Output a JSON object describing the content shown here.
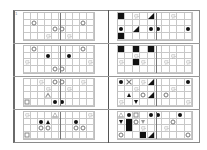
{
  "figure": {
    "label": "1",
    "grid": {
      "cols": 10,
      "rows": 4
    },
    "colors": {
      "frame": "#8a8a8a",
      "grid": "#c8c8c8",
      "ink": "#111111",
      "outline": "#777777"
    },
    "legend_symbols": [
      "circle",
      "gear",
      "dot",
      "square-fill",
      "square",
      "tri-corner",
      "tri-up",
      "tri-down",
      "tri-open",
      "x",
      "v"
    ],
    "panels": [
      {
        "id": "L1",
        "side": "left",
        "row": 0,
        "symbols": [
          {
            "c": 1,
            "r": 1,
            "t": "circle"
          },
          {
            "c": 8,
            "r": 1,
            "t": "circle"
          },
          {
            "c": 4,
            "r": 2,
            "t": "circle"
          },
          {
            "c": 5,
            "r": 2,
            "t": "circle"
          },
          {
            "c": 3,
            "r": 3,
            "t": "gear"
          },
          {
            "c": 6,
            "r": 3,
            "t": "gear"
          }
        ]
      },
      {
        "id": "R1",
        "side": "right",
        "row": 0,
        "symbols": [
          {
            "c": 0,
            "r": 0,
            "t": "square-fill"
          },
          {
            "c": 2,
            "r": 0,
            "t": "gear"
          },
          {
            "c": 4,
            "r": 0,
            "t": "tri-corner"
          },
          {
            "c": 7,
            "r": 0,
            "t": "gear"
          },
          {
            "c": 0,
            "r": 2,
            "t": "dot"
          },
          {
            "c": 2,
            "r": 2,
            "t": "tri-corner"
          },
          {
            "c": 4,
            "r": 2,
            "t": "dot"
          },
          {
            "c": 5,
            "r": 2,
            "t": "dot"
          },
          {
            "c": 9,
            "r": 2,
            "t": "dot"
          },
          {
            "c": 0,
            "r": 3,
            "t": "square-fill"
          }
        ]
      },
      {
        "id": "L2",
        "side": "left",
        "row": 1,
        "symbols": [
          {
            "c": 1,
            "r": 0,
            "t": "circle"
          },
          {
            "c": 8,
            "r": 0,
            "t": "circle"
          },
          {
            "c": 3,
            "r": 1,
            "t": "dot"
          },
          {
            "c": 6,
            "r": 1,
            "t": "dot"
          },
          {
            "c": 0,
            "r": 2,
            "t": "gear"
          },
          {
            "c": 9,
            "r": 2,
            "t": "gear"
          },
          {
            "c": 4,
            "r": 3,
            "t": "circle"
          },
          {
            "c": 5,
            "r": 3,
            "t": "circle"
          }
        ]
      },
      {
        "id": "R2",
        "side": "right",
        "row": 1,
        "symbols": [
          {
            "c": 0,
            "r": 0,
            "t": "square-fill"
          },
          {
            "c": 2,
            "r": 0,
            "t": "square-fill"
          },
          {
            "c": 4,
            "r": 0,
            "t": "square-fill"
          },
          {
            "c": 2,
            "r": 1,
            "t": "gear"
          },
          {
            "c": 7,
            "r": 1,
            "t": "gear"
          },
          {
            "c": 0,
            "r": 2,
            "t": "gear"
          },
          {
            "c": 2,
            "r": 2,
            "t": "square-fill"
          },
          {
            "c": 3,
            "r": 2,
            "t": "gear"
          },
          {
            "c": 6,
            "r": 2,
            "t": "gear"
          },
          {
            "c": 9,
            "r": 2,
            "t": "gear"
          }
        ]
      },
      {
        "id": "L3",
        "side": "left",
        "row": 2,
        "symbols": [
          {
            "c": 2,
            "r": 0,
            "t": "gear"
          },
          {
            "c": 4,
            "r": 0,
            "t": "circle"
          },
          {
            "c": 5,
            "r": 0,
            "t": "circle"
          },
          {
            "c": 8,
            "r": 0,
            "t": "gear"
          },
          {
            "c": 3,
            "r": 1,
            "t": "gear"
          },
          {
            "c": 6,
            "r": 1,
            "t": "gear"
          },
          {
            "c": 3,
            "r": 2,
            "t": "tri-open"
          },
          {
            "c": 0,
            "r": 3,
            "t": "square"
          },
          {
            "c": 4,
            "r": 3,
            "t": "dot"
          },
          {
            "c": 5,
            "r": 3,
            "t": "dot"
          }
        ]
      },
      {
        "id": "R3",
        "side": "right",
        "row": 2,
        "symbols": [
          {
            "c": 0,
            "r": 0,
            "t": "dot"
          },
          {
            "c": 1,
            "r": 0,
            "t": "x"
          },
          {
            "c": 3,
            "r": 0,
            "t": "gear"
          },
          {
            "c": 4,
            "r": 0,
            "t": "tri-corner"
          },
          {
            "c": 9,
            "r": 0,
            "t": "dot"
          },
          {
            "c": 2,
            "r": 1,
            "t": "gear"
          },
          {
            "c": 7,
            "r": 1,
            "t": "gear"
          },
          {
            "c": 1,
            "r": 2,
            "t": "tri-up"
          },
          {
            "c": 3,
            "r": 2,
            "t": "circle"
          },
          {
            "c": 4,
            "r": 2,
            "t": "tri-corner"
          },
          {
            "c": 6,
            "r": 2,
            "t": "circle"
          },
          {
            "c": 0,
            "r": 3,
            "t": "gear"
          },
          {
            "c": 2,
            "r": 3,
            "t": "tri-down"
          },
          {
            "c": 9,
            "r": 3,
            "t": "gear"
          }
        ]
      },
      {
        "id": "L4",
        "side": "left",
        "row": 3,
        "symbols": [
          {
            "c": 0,
            "r": 0,
            "t": "gear"
          },
          {
            "c": 4,
            "r": 0,
            "t": "tri-open"
          },
          {
            "c": 9,
            "r": 0,
            "t": "gear"
          },
          {
            "c": 2,
            "r": 1,
            "t": "dot"
          },
          {
            "c": 3,
            "r": 1,
            "t": "tri-up"
          },
          {
            "c": 7,
            "r": 1,
            "t": "dot"
          },
          {
            "c": 2,
            "r": 2,
            "t": "circle"
          },
          {
            "c": 3,
            "r": 2,
            "t": "circle"
          },
          {
            "c": 7,
            "r": 2,
            "t": "circle"
          },
          {
            "c": 8,
            "r": 2,
            "t": "circle"
          },
          {
            "c": 0,
            "r": 3,
            "t": "square"
          }
        ]
      },
      {
        "id": "R4",
        "side": "right",
        "row": 3,
        "symbols": [
          {
            "c": 0,
            "r": 0,
            "t": "tri-open"
          },
          {
            "c": 1,
            "r": 0,
            "t": "dot"
          },
          {
            "c": 2,
            "r": 0,
            "t": "square"
          },
          {
            "c": 4,
            "r": 0,
            "t": "dot"
          },
          {
            "c": 5,
            "r": 0,
            "t": "dot"
          },
          {
            "c": 8,
            "r": 0,
            "t": "dot"
          },
          {
            "c": 0,
            "r": 1,
            "t": "tri-down"
          },
          {
            "c": 1,
            "r": 1,
            "t": "square-fill"
          },
          {
            "c": 2,
            "r": 1,
            "t": "circle"
          },
          {
            "c": 3,
            "r": 1,
            "t": "v"
          },
          {
            "c": 7,
            "r": 1,
            "t": "circle"
          },
          {
            "c": 1,
            "r": 2,
            "t": "square-fill"
          },
          {
            "c": 3,
            "r": 2,
            "t": "gear"
          },
          {
            "c": 6,
            "r": 2,
            "t": "gear"
          },
          {
            "c": 0,
            "r": 3,
            "t": "circle"
          },
          {
            "c": 3,
            "r": 3,
            "t": "square-fill"
          },
          {
            "c": 4,
            "r": 3,
            "t": "tri-corner"
          },
          {
            "c": 9,
            "r": 3,
            "t": "circle"
          }
        ]
      }
    ]
  }
}
